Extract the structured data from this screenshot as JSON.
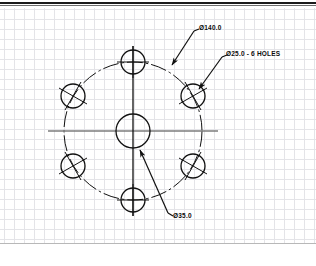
{
  "drawing": {
    "title": "Bolt circle hole pattern",
    "background_color": "#ffffff",
    "line_color": "#111111",
    "grid_color": "#c9c9d2",
    "grid_spacing_px": 10
  },
  "annotations": [
    {
      "id": "bolt-circle-dia",
      "text": "Ø140.0",
      "x": 196,
      "y": 27
    },
    {
      "id": "hole-dia-count",
      "text": "Ø25.0 - 6 HOLES",
      "x": 224,
      "y": 53
    },
    {
      "id": "center-bore-dia",
      "text": "Ø35.0",
      "x": 170,
      "y": 215
    }
  ],
  "geometry": {
    "center": {
      "x": 133,
      "y": 131
    },
    "center_bore_radius": 17,
    "bolt_circle_radius": 69,
    "hole_radius": 12,
    "hole_count": 6,
    "hole_centers": [
      {
        "x": 133,
        "y": 62,
        "angle_deg": 90
      },
      {
        "x": 193,
        "y": 96,
        "angle_deg": 30
      },
      {
        "x": 193,
        "y": 166,
        "angle_deg": 330
      },
      {
        "x": 133,
        "y": 200,
        "angle_deg": 270
      },
      {
        "x": 73,
        "y": 166,
        "angle_deg": 210
      },
      {
        "x": 73,
        "y": 96,
        "angle_deg": 150
      }
    ]
  },
  "leaders": [
    {
      "id": "leader-bolt-circle",
      "from": {
        "x": 194,
        "y": 31
      },
      "to": {
        "x": 171,
        "y": 66
      }
    },
    {
      "id": "leader-hole",
      "from": {
        "x": 222,
        "y": 57
      },
      "to": {
        "x": 198,
        "y": 88
      }
    },
    {
      "id": "leader-center-bore",
      "from": {
        "x": 168,
        "y": 214
      },
      "to": {
        "x": 139,
        "y": 149
      }
    }
  ]
}
